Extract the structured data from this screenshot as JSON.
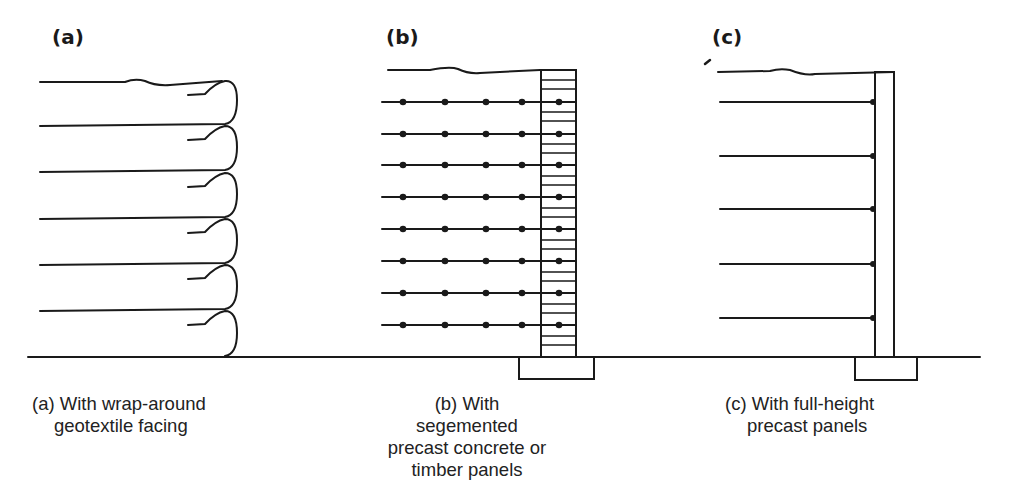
{
  "figure": {
    "panels": [
      {
        "id": "a",
        "label": "(a)",
        "caption_lines": [
          "(a) With wrap-around",
          "geotextile facing"
        ],
        "facing": "wrap-around geotextile",
        "layers": 6
      },
      {
        "id": "b",
        "label": "(b)",
        "caption_lines": [
          "(b) With segemented",
          "precast concrete or",
          "timber panels"
        ],
        "facing": "segmented precast concrete or timber panels",
        "strip_rows": 8,
        "dots_per_row": 5
      },
      {
        "id": "c",
        "label": "(c)",
        "caption_lines": [
          "(c) With full-height",
          "precast panels"
        ],
        "facing": "full-height precast panel",
        "strip_rows": 5
      }
    ],
    "colors": {
      "line": "#1a1a1a",
      "background": "#ffffff"
    }
  }
}
